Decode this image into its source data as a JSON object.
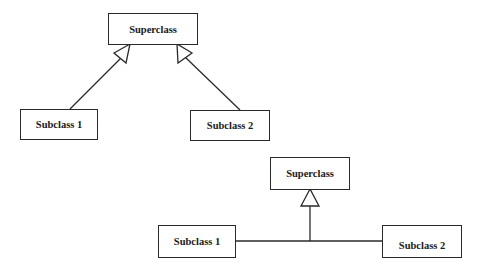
{
  "diagrams": [
    {
      "name": "separate-arrows-style",
      "superclass": {
        "label": "Superclass"
      },
      "subclasses": [
        {
          "label": "Subclass 1"
        },
        {
          "label": "Subclass 2"
        }
      ]
    },
    {
      "name": "shared-arrow-style",
      "superclass": {
        "label": "Superclass"
      },
      "subclasses": [
        {
          "label": "Subclass 1"
        },
        {
          "label": "Subclass 2"
        }
      ]
    }
  ],
  "colors": {
    "line": "#2a2a2a",
    "background": "#ffffff"
  }
}
